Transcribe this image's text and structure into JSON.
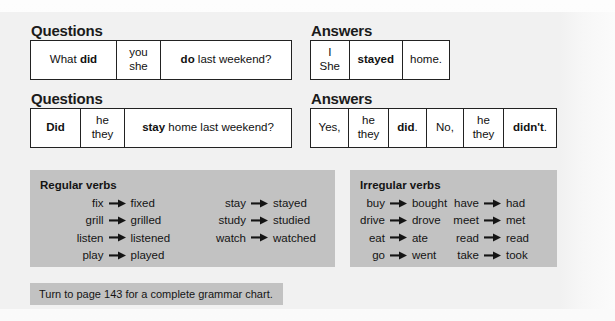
{
  "sections": {
    "questions_label": "Questions",
    "answers_label": "Answers"
  },
  "tables": {
    "question_1": {
      "name": "past-simple-wh-question",
      "cells": [
        {
          "parts": [
            {
              "text": "What ",
              "bold": false
            },
            {
              "text": "did",
              "bold": true
            }
          ]
        },
        {
          "lines": [
            "you",
            "she"
          ]
        },
        {
          "parts": [
            {
              "text": "do",
              "bold": true
            },
            {
              "text": " last weekend?",
              "bold": false
            }
          ]
        }
      ]
    },
    "answer_1": {
      "name": "past-simple-statement-answer",
      "cells": [
        {
          "lines": [
            "I",
            "She"
          ]
        },
        {
          "parts": [
            {
              "text": "stayed",
              "bold": true
            }
          ]
        },
        {
          "parts": [
            {
              "text": "home.",
              "bold": false
            }
          ]
        }
      ]
    },
    "question_2": {
      "name": "past-simple-yesno-question",
      "cells": [
        {
          "parts": [
            {
              "text": "Did",
              "bold": true
            }
          ]
        },
        {
          "lines": [
            "he",
            "they"
          ]
        },
        {
          "parts": [
            {
              "text": "stay",
              "bold": true
            },
            {
              "text": " home last weekend?",
              "bold": false
            }
          ]
        }
      ]
    },
    "answer_2": {
      "name": "past-simple-short-answers",
      "cells": [
        {
          "parts": [
            {
              "text": "Yes,",
              "bold": false
            }
          ]
        },
        {
          "lines": [
            "he",
            "they"
          ]
        },
        {
          "parts": [
            {
              "text": "did",
              "bold": true
            },
            {
              "text": ".",
              "bold": false
            }
          ]
        },
        {
          "parts": [
            {
              "text": "No,",
              "bold": false
            }
          ]
        },
        {
          "lines": [
            "he",
            "they"
          ]
        },
        {
          "parts": [
            {
              "text": "didn't",
              "bold": true
            },
            {
              "text": ".",
              "bold": false
            }
          ]
        }
      ]
    }
  },
  "panels": {
    "regular": {
      "title": "Regular verbs",
      "columns": [
        [
          {
            "base": "fix",
            "past": "fixed"
          },
          {
            "base": "grill",
            "past": "grilled"
          },
          {
            "base": "listen",
            "past": "listened"
          },
          {
            "base": "play",
            "past": "played"
          }
        ],
        [
          {
            "base": "stay",
            "past": "stayed"
          },
          {
            "base": "study",
            "past": "studied"
          },
          {
            "base": "watch",
            "past": "watched"
          }
        ]
      ]
    },
    "irregular": {
      "title": "Irregular verbs",
      "columns": [
        [
          {
            "base": "buy",
            "past": "bought"
          },
          {
            "base": "drive",
            "past": "drove"
          },
          {
            "base": "eat",
            "past": "ate"
          },
          {
            "base": "go",
            "past": "went"
          }
        ],
        [
          {
            "base": "have",
            "past": "had"
          },
          {
            "base": "meet",
            "past": "met"
          },
          {
            "base": "read",
            "past": "read"
          },
          {
            "base": "take",
            "past": "took"
          }
        ]
      ]
    }
  },
  "footer": {
    "note": "Turn to page 143 for a complete grammar chart."
  },
  "colors": {
    "panel_gray": "#c2c2c2",
    "band_gray": "#f1f1f1",
    "table_border": "#222222",
    "text": "#111111"
  }
}
